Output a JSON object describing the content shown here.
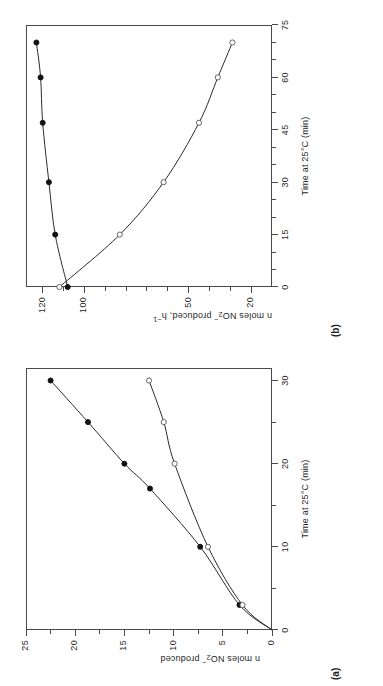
{
  "figure": {
    "panels": [
      {
        "tag": "(b)",
        "xlabel_pre": "Time at 25",
        "xlabel_deg": "°C",
        "xlabel_post": "(min)",
        "xlabel_full": "Time at 25°C  (min)",
        "ylabel_full": "n moles NO2- produced, h-1",
        "ylabel_a": "n moles NO",
        "ylabel_sub": "2",
        "ylabel_sup": "−",
        "ylabel_b": " produced, h",
        "ylabel_sup2": "−1",
        "xticks": [
          0,
          15,
          30,
          45,
          60,
          75
        ],
        "yticks": [
          20,
          50,
          100,
          120
        ]
      },
      {
        "tag": "(a)",
        "xlabel_pre": "Time at 25",
        "xlabel_deg": "°C",
        "xlabel_post": "(min)",
        "xlabel_full": "Time at 25°C  (min)",
        "ylabel_full": "n moles NO2- produced",
        "ylabel_a": "n moles NO",
        "ylabel_sub": "2",
        "ylabel_sup": "−",
        "ylabel_b": " produced",
        "ylabel_sup2": "",
        "xticks": [
          0,
          10,
          20,
          30
        ],
        "yticks": [
          0,
          5,
          10,
          15,
          20,
          25
        ]
      }
    ]
  },
  "chart_data": [
    {
      "panel": "(a)",
      "type": "line",
      "title": "",
      "xlabel": "Time at 25°C (min)",
      "ylabel": "n moles NO2- produced",
      "xlim": [
        0,
        31.5
      ],
      "ylim": [
        0,
        25
      ],
      "xticks": [
        0,
        10,
        20,
        30
      ],
      "xticks_minor": [
        5,
        15,
        25
      ],
      "yticks": [
        0,
        5,
        10,
        15,
        20,
        25
      ],
      "grid": false,
      "legend": "none",
      "series": [
        {
          "name": "filled-circles",
          "marker": "filled circle",
          "x": [
            0,
            3,
            10,
            17,
            20,
            25,
            30
          ],
          "y": [
            0,
            3.3,
            7.3,
            12.4,
            15.0,
            18.7,
            22.5
          ]
        },
        {
          "name": "open-circles",
          "marker": "open circle",
          "x": [
            0,
            3,
            10,
            20,
            25,
            30
          ],
          "y": [
            0,
            3.0,
            6.5,
            9.9,
            11.0,
            12.5
          ]
        }
      ]
    },
    {
      "panel": "(b)",
      "type": "line",
      "title": "",
      "xlabel": "Time at 25°C (min)",
      "ylabel": "n moles NO2- produced, h-1",
      "xlim": [
        0,
        75
      ],
      "ylim": [
        10,
        128
      ],
      "xticks": [
        0,
        15,
        30,
        45,
        60,
        75
      ],
      "xticks_minor": [
        5,
        10,
        20,
        25,
        35,
        40,
        50,
        55,
        65,
        70
      ],
      "yticks": [
        20,
        50,
        100,
        120
      ],
      "grid": false,
      "legend": "none",
      "series": [
        {
          "name": "filled-circles",
          "marker": "filled circle",
          "x": [
            0,
            15,
            30,
            47,
            60,
            70
          ],
          "y": [
            108,
            114,
            117,
            120,
            121,
            123
          ]
        },
        {
          "name": "open-circles",
          "marker": "open circle",
          "x": [
            0,
            15,
            30,
            47,
            60,
            70
          ],
          "y": [
            112,
            83,
            62,
            45,
            36,
            29
          ]
        }
      ]
    }
  ]
}
